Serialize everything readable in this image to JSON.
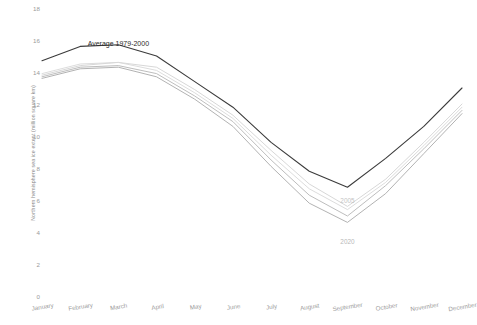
{
  "chart_data": {
    "type": "line",
    "title": "",
    "xlabel": "",
    "ylabel": "Northern hemisphere sea ice extent (million square km)",
    "categories": [
      "January",
      "February",
      "March",
      "April",
      "May",
      "June",
      "July",
      "August",
      "September",
      "October",
      "November",
      "December"
    ],
    "ylim": [
      0,
      18
    ],
    "yticks": [
      0,
      2,
      4,
      6,
      8,
      10,
      12,
      14,
      16,
      18
    ],
    "grid": false,
    "legend_position": "inline-annotations",
    "series": [
      {
        "name": "Average 1979-2000",
        "color": "#3b3b3b",
        "width": 1.1,
        "values": [
          14.7,
          15.6,
          15.7,
          15.0,
          13.4,
          11.8,
          9.6,
          7.8,
          6.8,
          8.6,
          10.6,
          13.0
        ]
      },
      {
        "name": "2005",
        "color": "#d2d2d2",
        "width": 0.9,
        "values": [
          13.8,
          14.4,
          14.6,
          14.3,
          12.9,
          11.3,
          9.1,
          7.0,
          5.6,
          7.3,
          9.6,
          12.0
        ]
      },
      {
        "name": "series-light-a",
        "color": "#d8d8d8",
        "width": 0.9,
        "values": [
          13.9,
          14.5,
          14.6,
          14.1,
          12.7,
          11.1,
          8.8,
          6.7,
          5.4,
          7.1,
          9.4,
          11.8
        ]
      },
      {
        "name": "series-mid-b",
        "color": "#b6b6b6",
        "width": 0.9,
        "values": [
          13.7,
          14.3,
          14.4,
          13.9,
          12.5,
          10.9,
          8.5,
          6.3,
          5.0,
          6.9,
          9.2,
          11.6
        ]
      },
      {
        "name": "2020",
        "color": "#a9a9a9",
        "width": 0.9,
        "values": [
          13.6,
          14.2,
          14.3,
          13.7,
          12.3,
          10.6,
          8.1,
          5.8,
          4.6,
          6.4,
          8.9,
          11.4
        ]
      }
    ],
    "annotations": [
      {
        "name": "average-label",
        "text": "Average 1979-2000",
        "x_month": "March",
        "y_value": 16.0
      },
      {
        "name": "year-2005-label",
        "text": "2005",
        "x_month": "September",
        "y_value": 6.2
      },
      {
        "name": "year-2020-label",
        "text": "2020",
        "x_month": "September",
        "y_value": 3.6
      }
    ]
  },
  "axes": {
    "y_label_text": "Northern hemisphere sea ice extent (million square km)",
    "y_tick_labels": [
      "18",
      "16",
      "14",
      "12",
      "10",
      "8",
      "6",
      "4",
      "2",
      "0"
    ],
    "x_tick_labels": [
      "January",
      "February",
      "March",
      "April",
      "May",
      "June",
      "July",
      "August",
      "September",
      "October",
      "November",
      "December"
    ]
  },
  "colors": {
    "background": "#ffffff",
    "tick_text": "#9a9a9a",
    "axis_label_text": "#8a8a8a",
    "average_line": "#3b3b3b",
    "year_line_2020": "#a9a9a9",
    "year_line_2005": "#d2d2d2"
  }
}
